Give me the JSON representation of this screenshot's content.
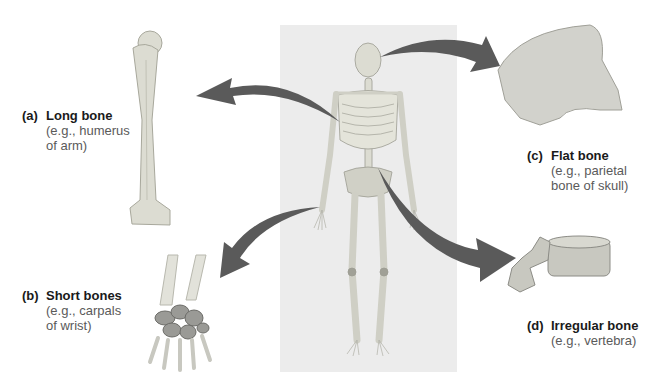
{
  "figure": {
    "colors": {
      "panel": "#ececec",
      "arrow": "#5a5a5a",
      "bone": "#dcdcd2",
      "bone_shade": "#b8b8ac",
      "carpal": "#9a9a96"
    },
    "labels": [
      {
        "id": "a",
        "letter": "(a)",
        "title": "Long bone",
        "sub1": "(e.g., humerus",
        "sub2": "of arm)"
      },
      {
        "id": "b",
        "letter": "(b)",
        "title": "Short bones",
        "sub1": "(e.g., carpals",
        "sub2": "of wrist)"
      },
      {
        "id": "c",
        "letter": "(c)",
        "title": "Flat bone",
        "sub1": "(e.g., parietal",
        "sub2": "bone of skull)"
      },
      {
        "id": "d",
        "letter": "(d)",
        "title": "Irregular bone",
        "sub1": "(e.g., vertebra)"
      }
    ]
  }
}
